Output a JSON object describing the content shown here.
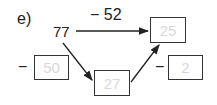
{
  "exercise": {
    "label": "e)",
    "start_value": "77",
    "top_operation": "− 52",
    "left_operator": "−",
    "right_operator": "−",
    "boxes": {
      "result_top": "25",
      "left_operand": "50",
      "middle": "27",
      "right_operand": "2"
    }
  }
}
